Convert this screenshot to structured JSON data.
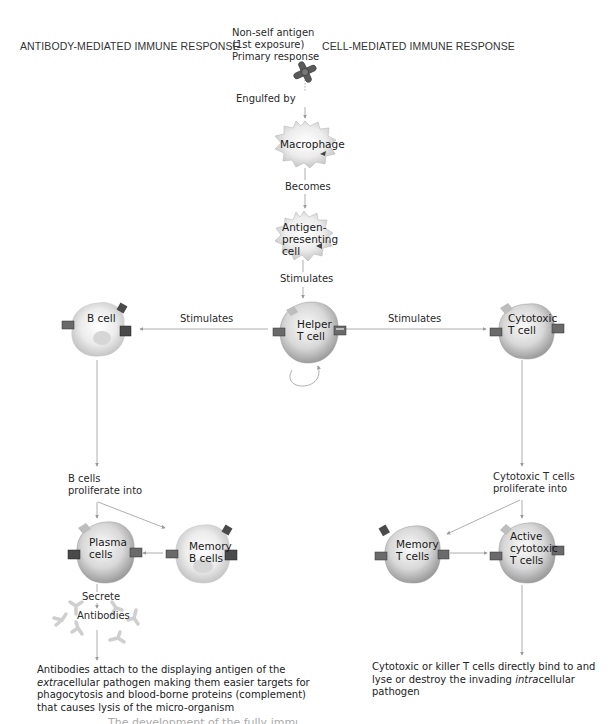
{
  "headings": {
    "left": "ANTIBODY-MEDIATED IMMUNE RESPONSE",
    "right": "CELL-MEDIATED IMMUNE RESPONSE"
  },
  "center": {
    "antigen_label": [
      "Non-self antigen",
      "(1st exposure)",
      "Primary response"
    ],
    "engulfed_by": "Engulfed by",
    "macrophage": "Macrophage",
    "becomes": "Becomes",
    "apc": [
      "Antigen-",
      "presenting",
      "cell"
    ],
    "stimulates": "Stimulates",
    "helper_t": [
      "Helper",
      "T cell"
    ]
  },
  "left": {
    "stimulates": "Stimulates",
    "b_cell": "B cell",
    "b_proliferate": [
      "B cells",
      "proliferate into"
    ],
    "plasma": [
      "Plasma",
      "cells"
    ],
    "memory_b": [
      "Memory",
      "B cells"
    ],
    "secrete": "Secrete",
    "antibodies": "Antibodies",
    "outcome": {
      "line1": "Antibodies attach to the displaying antigen of the",
      "line2_italic": "extra",
      "line2_rest": "cellular pathogen making them easier targets for",
      "line3": "phagocytosis and blood-borne proteins (complement)",
      "line4": "that causes lysis of the micro-organism"
    }
  },
  "right": {
    "stimulates": "Stimulates",
    "cytotoxic_t": [
      "Cytotoxic",
      "T cell"
    ],
    "ct_proliferate": [
      "Cytotoxic T cells",
      "proliferate into"
    ],
    "memory_t": [
      "Memory",
      "T cells"
    ],
    "active_ct": [
      "Active",
      "cytotoxic",
      "T cells"
    ],
    "outcome": {
      "line1": "Cytotoxic or killer T cells directly bind to and",
      "line2_pre": "lyse or destroy the invading ",
      "line2_italic": "intra",
      "line2_rest": "cellular pathogen"
    }
  },
  "footer": {
    "caption_fragment": "The development of the fully immune system"
  },
  "colors": {
    "arrow": "#9a9a9a",
    "cell_light": "#f2f2f2",
    "cell_dark": "#9c9c9c",
    "receptor": "#4a4a4a",
    "text": "#222222"
  }
}
